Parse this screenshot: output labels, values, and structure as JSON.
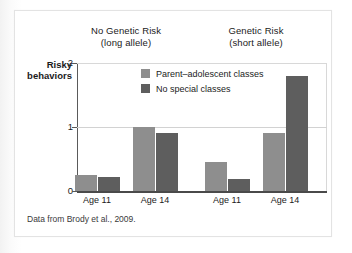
{
  "figure": {
    "source_note": "Data from Brody et al., 2009."
  },
  "groups": [
    {
      "line1": "No Genetic Risk",
      "line2": "(long allele)"
    },
    {
      "line1": "Genetic Risk",
      "line2": "(short allele)"
    }
  ],
  "axis": {
    "y_title_line1": "Risky",
    "y_title_line2": "behaviors",
    "y_ticks": [
      "0",
      "1",
      "2"
    ]
  },
  "legend": {
    "items": [
      {
        "label": "Parent–adolescent classes",
        "color": "#8e8e8e"
      },
      {
        "label": "No special classes",
        "color": "#5e5e5e"
      }
    ]
  },
  "chart_data": {
    "type": "bar",
    "title": "",
    "subtitle": "",
    "xlabel": "",
    "ylabel": "Risky behaviors",
    "ylim": [
      0,
      2
    ],
    "yticks": [
      0,
      1,
      2
    ],
    "grid": true,
    "legend_position": "inside-top-center",
    "group_labels": [
      "No Genetic Risk (long allele)",
      "Genetic Risk (short allele)"
    ],
    "categories": [
      "Age 11",
      "Age 14",
      "Age 11",
      "Age 14"
    ],
    "series": [
      {
        "name": "Parent–adolescent classes",
        "color": "#8e8e8e",
        "values": [
          0.25,
          1.0,
          0.45,
          0.9
        ]
      },
      {
        "name": "No special classes",
        "color": "#5e5e5e",
        "values": [
          0.22,
          0.9,
          0.18,
          1.8
        ]
      }
    ],
    "annotations": [
      "Data from Brody et al., 2009."
    ]
  },
  "layout": {
    "plot_left": 62,
    "plot_right": 312,
    "plot_top": 52,
    "plot_bottom": 180,
    "group_centers": [
      111,
      241
    ],
    "cluster_centers": [
      82,
      140,
      212,
      270
    ],
    "bar_width": 22,
    "bar_gap": 1
  }
}
